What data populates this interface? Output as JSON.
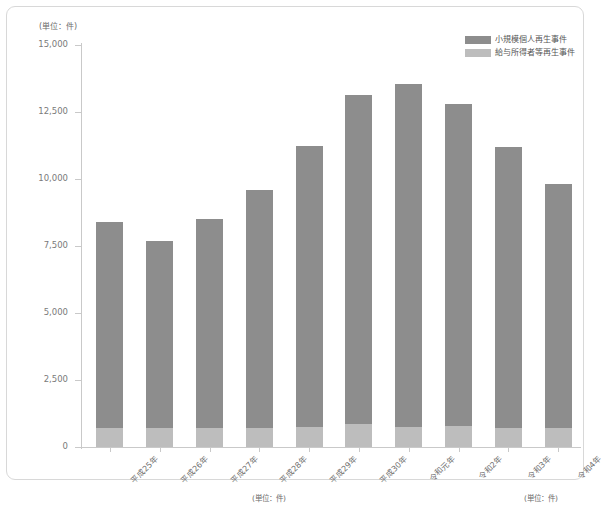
{
  "chart_data": {
    "type": "bar",
    "stacked": true,
    "title": "",
    "subtitle": "",
    "xlabel": "",
    "ylabel": "",
    "unit_label": "(単位：件)",
    "ylim": [
      0,
      15000
    ],
    "yticks": [
      0,
      2500,
      5000,
      7500,
      10000,
      12500,
      15000
    ],
    "ytick_labels": [
      "0",
      "2,500",
      "5,000",
      "7,500",
      "10,000",
      "12,500",
      "15,000"
    ],
    "grid": false,
    "legend_position": "top-right",
    "categories": [
      "平成25年",
      "平成26年",
      "平成27年",
      "平成28年",
      "平成29年",
      "平成30年",
      "令和元年",
      "令和2年",
      "令和3年",
      "令和4年"
    ],
    "series": [
      {
        "name": "小規模個人再生事件",
        "color": "#8d8d8d",
        "values": [
          7700,
          7000,
          7800,
          8900,
          10500,
          12300,
          12800,
          12000,
          10500,
          9100
        ]
      },
      {
        "name": "給与所得者等再生事件",
        "color": "#bdbdbd",
        "values": [
          700,
          700,
          700,
          700,
          750,
          850,
          750,
          800,
          700,
          700
        ]
      }
    ],
    "totals": [
      8400,
      7700,
      8500,
      9600,
      11250,
      13150,
      13550,
      12800,
      11200,
      9800
    ]
  },
  "legend": {
    "items": [
      {
        "label": "小規模個人再生事件",
        "color": "#8d8d8d"
      },
      {
        "label": "給与所得者等再生事件",
        "color": "#bdbdbd"
      }
    ]
  },
  "footer": {
    "unit_left": "(単位：件)",
    "unit_right": "(単位：件)"
  },
  "colors": {
    "series_upper": "#8d8d8d",
    "series_lower": "#bdbdbd",
    "axis": "#c9c9c9",
    "text": "#6f6f6f",
    "card_border": "#d8d8d8",
    "background": "#ffffff"
  }
}
